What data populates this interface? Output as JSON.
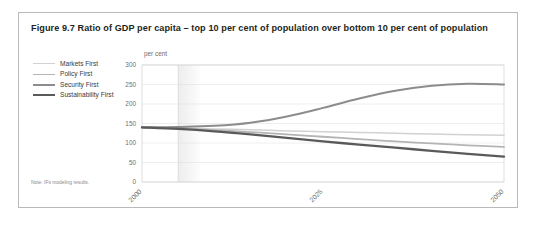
{
  "figure": {
    "title": "Figure 9.7 Ratio of GDP per capita – top 10 per cent of population over bottom 10 per cent of population",
    "note": "Note: IFs modeling results."
  },
  "legend": {
    "position": "top-left-outside",
    "items": [
      {
        "label": "Markets First",
        "color": "#d2d2d2",
        "width": 1.5
      },
      {
        "label": "Policy First",
        "color": "#b4b4b4",
        "width": 1.8
      },
      {
        "label": "Security First",
        "color": "#8c8c8c",
        "width": 2.0
      },
      {
        "label": "Sustainability First",
        "color": "#5a5a5a",
        "width": 2.3
      }
    ]
  },
  "chart_data": {
    "type": "line",
    "title": "Figure 9.7 Ratio of GDP per capita – top 10 per cent of population over bottom 10 per cent of population",
    "xlabel": "",
    "ylabel": "per cent",
    "unit_label": "per cent",
    "xlim": [
      2000,
      2050
    ],
    "ylim": [
      0,
      300
    ],
    "yticks": [
      0,
      50,
      100,
      150,
      200,
      250,
      300
    ],
    "xticks": [
      2000,
      2025,
      2050
    ],
    "xtick_labels": [
      "2000",
      "2025",
      "2050"
    ],
    "grid": "horizontal",
    "x": [
      2000,
      2005,
      2010,
      2015,
      2020,
      2025,
      2030,
      2035,
      2040,
      2045,
      2050
    ],
    "series": [
      {
        "name": "Markets First",
        "color": "#d2d2d2",
        "values": [
          140,
          138,
          136,
          134,
          131,
          129,
          127,
          125,
          123,
          121,
          120
        ]
      },
      {
        "name": "Policy First",
        "color": "#b4b4b4",
        "values": [
          140,
          137,
          133,
          128,
          122,
          116,
          110,
          104,
          99,
          94,
          90
        ]
      },
      {
        "name": "Security First",
        "color": "#8c8c8c",
        "values": [
          140,
          141,
          144,
          152,
          168,
          190,
          214,
          234,
          247,
          252,
          250
        ]
      },
      {
        "name": "Sustainability First",
        "color": "#5a5a5a",
        "values": [
          140,
          136,
          130,
          122,
          113,
          104,
          96,
          88,
          80,
          72,
          65
        ]
      }
    ],
    "shaded_band": {
      "from": 2005,
      "to": 2008,
      "color": "#ededed"
    }
  }
}
